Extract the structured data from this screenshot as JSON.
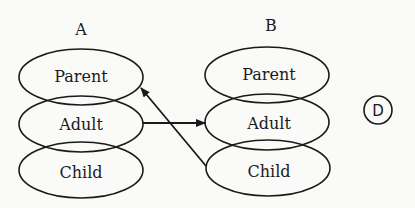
{
  "diagram": {
    "columns": [
      {
        "label": "A",
        "items": [
          "Parent",
          "Adult",
          "Child"
        ]
      },
      {
        "label": "B",
        "items": [
          "Parent",
          "Adult",
          "Child"
        ]
      }
    ],
    "badge": {
      "label": "D"
    },
    "arrows": [
      {
        "from": "A.Adult",
        "to": "B.Adult"
      },
      {
        "from": "B.Child",
        "to": "A.Parent"
      }
    ],
    "colors": {
      "stroke": "#1a1a1a",
      "background": "#fafaf8"
    }
  }
}
